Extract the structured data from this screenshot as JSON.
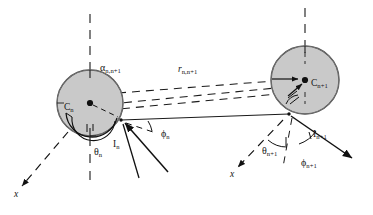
{
  "figure": {
    "background_color": "#ffffff",
    "stroke_color": "#1a1a1a",
    "sphere_fill": "#c9c9c9",
    "sphere_stroke": "#3a3a3a"
  },
  "labels": {
    "c_n": {
      "base": "C",
      "sub": "n"
    },
    "c_n1": {
      "base": "C",
      "sub": "n+1"
    },
    "i_n": {
      "base": "I",
      "sub": "n"
    },
    "i_n1": {
      "base": "I",
      "sub": "n+1"
    },
    "alpha": {
      "base": "α",
      "sub": "n,n+1"
    },
    "r": {
      "base": "r",
      "sub": "n,n+1"
    },
    "theta_n": {
      "base": "θ",
      "sub": "n"
    },
    "theta_n1": {
      "base": "θ",
      "sub": "n+1"
    },
    "phi_n": {
      "base": "ϕ",
      "sub": "n"
    },
    "phi_n1": {
      "base": "ϕ",
      "sub": "n+1"
    },
    "x_left": "x",
    "x_right": "x"
  },
  "geometry": {
    "sphere_left": {
      "cx": 90,
      "cy": 103,
      "r": 33
    },
    "sphere_right": {
      "cx": 305,
      "cy": 80,
      "r": 34
    },
    "contact_left": {
      "x": 121,
      "y": 120
    },
    "contact_right": {
      "x": 288,
      "y": 114
    },
    "center_left": {
      "x": 90,
      "y": 103
    },
    "center_right": {
      "x": 305,
      "y": 80
    }
  },
  "elements": {
    "vertical_axis_left": "dashed vertical reference axis above sphere n",
    "vertical_axis_right": "dashed vertical reference axis above sphere n+1",
    "separation_lines": "dashed lines joining the two spheres",
    "center_line": "solid line from contact point I(n) to contact point I(n+1)",
    "x_axis_left": "dashed arrow to lower-left labelled x",
    "x_axis_right": "dashed arrow to lower-left labelled x",
    "orientation_arrow_left": "solid arrow into contact point I(n)",
    "orientation_arrow_right": "solid arrow out of contact point I(n+1)"
  }
}
